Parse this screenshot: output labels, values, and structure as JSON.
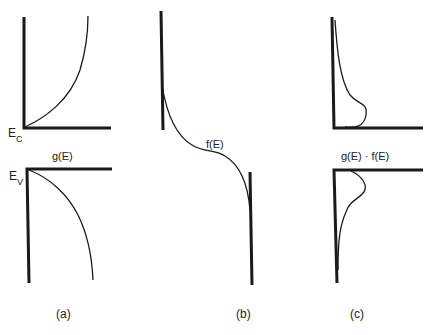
{
  "panels": {
    "a": {
      "caption": "(a)",
      "function_label": "g(E)",
      "ec_label": "E",
      "ec_sub": "C",
      "ev_label": "E",
      "ev_sub": "V"
    },
    "b": {
      "caption": "(b)",
      "function_label": "f(E)"
    },
    "c": {
      "caption": "(c)",
      "function_label": "g(E) · f(E)"
    }
  },
  "colors": {
    "line": "#1a1a1a",
    "background": "#ffffff"
  }
}
